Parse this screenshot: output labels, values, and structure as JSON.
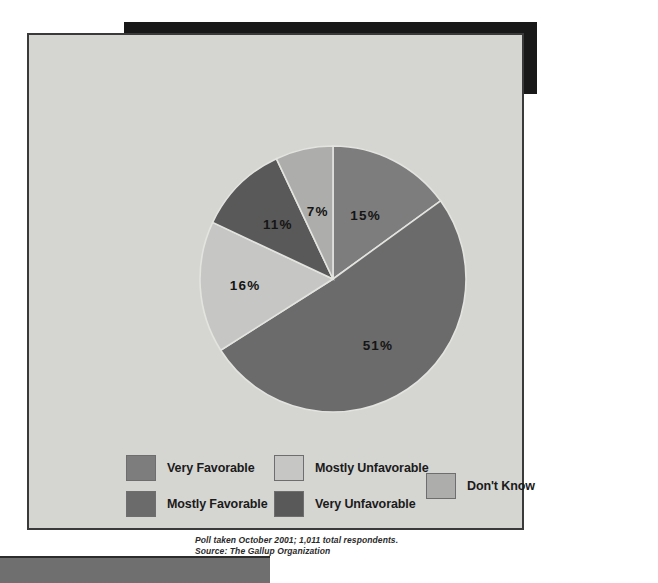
{
  "title": {
    "text": "What is your opinion of people of the Islamic faith\n(Muslims)?"
  },
  "source_note": {
    "line1": "Poll taken October 2001; 1,011 total respondents.",
    "line2": "Source: The Gallup Organization",
    "combined": "Poll taken October 2001; 1,011 total respondents.\nSource: The Gallup Organization"
  },
  "legend": {
    "items": [
      {
        "label": "Very Favorable",
        "color": "#7d7d7d",
        "pos": "r0c0"
      },
      {
        "label": "Mostly Favorable",
        "color": "#6b6b6b",
        "pos": "r1c0"
      },
      {
        "label": "Mostly Unfavorable",
        "color": "#c6c6c4",
        "pos": "r0c1"
      },
      {
        "label": "Very Unfavorable",
        "color": "#595959",
        "pos": "r1c1"
      },
      {
        "label": "Don't Know",
        "color": "#adadab",
        "pos": "dk"
      }
    ]
  },
  "chart_data": {
    "type": "pie",
    "title": "What is your opinion of people of the Islamic faith (Muslims)?",
    "categories": [
      "Very Favorable",
      "Mostly Favorable",
      "Mostly Unfavorable",
      "Very Unfavorable",
      "Don't Know"
    ],
    "values": [
      15,
      51,
      16,
      11,
      7
    ],
    "value_labels": [
      "15%",
      "51%",
      "16%",
      "11%",
      "7%"
    ],
    "unit": "percent",
    "colors": [
      "#7d7d7d",
      "#6b6b6b",
      "#c6c6c4",
      "#595959",
      "#adadab"
    ],
    "start_angle_deg": 0,
    "direction": "clockwise",
    "legend_position": "bottom",
    "grid": false,
    "xlabel": "",
    "ylabel": "",
    "annotations": [
      "Poll taken October 2001; 1,011 total respondents.",
      "Source: The Gallup Organization"
    ]
  }
}
